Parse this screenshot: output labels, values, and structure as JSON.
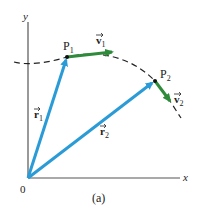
{
  "figure": {
    "caption": "(a)",
    "colors": {
      "position_vector": "#2a9bd6",
      "velocity_vector": "#2e8b3a",
      "axes": "#555555",
      "path": "#222222",
      "text": "#222222"
    },
    "axes": {
      "x_label": "x",
      "y_label": "y",
      "origin_label": "0"
    },
    "points": [
      {
        "name": "P",
        "sub": "1"
      },
      {
        "name": "P",
        "sub": "2"
      }
    ],
    "position_vectors": [
      {
        "symbol": "r",
        "sub": "1"
      },
      {
        "symbol": "r",
        "sub": "2"
      }
    ],
    "velocity_vectors": [
      {
        "symbol": "v",
        "sub": "1"
      },
      {
        "symbol": "v",
        "sub": "2"
      }
    ],
    "path": {
      "style": "dashed",
      "description": "curved trajectory"
    }
  }
}
